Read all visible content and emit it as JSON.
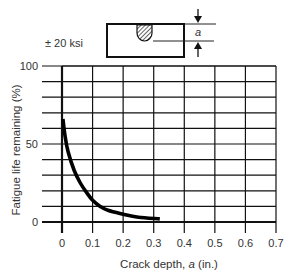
{
  "chart_data": {
    "type": "line",
    "title": "",
    "xlabel": "Crack depth, a (in.)",
    "ylabel": "Fatigue life remaining (%)",
    "xlim": [
      0,
      0.7
    ],
    "ylim": [
      0,
      100
    ],
    "x_ticks": [
      "0",
      "0.1",
      "0.2",
      "0.3",
      "0.4",
      "0.5",
      "0.6",
      "0.7"
    ],
    "y_ticks": [
      "0",
      "50",
      "100"
    ],
    "y_minor_gridlines_every": 10,
    "grid": true,
    "legend": null,
    "series": [
      {
        "name": "Fatigue life remaining",
        "x": [
          0.003,
          0.01,
          0.02,
          0.04,
          0.06,
          0.08,
          0.1,
          0.125,
          0.15,
          0.2,
          0.25,
          0.32
        ],
        "y": [
          66,
          55,
          45,
          33,
          25,
          19,
          14,
          10,
          7.5,
          5,
          3,
          2
        ]
      }
    ],
    "annotations": [
      {
        "text": "± 20 ksi",
        "role": "stress-amplitude-label"
      },
      {
        "text": "a",
        "role": "crack-depth-dimension-label"
      }
    ]
  },
  "annotations": {
    "stress_label": "± 20 ksi",
    "dimension_label": "a"
  },
  "axes": {
    "xlabel_prefix": "Crack depth, ",
    "xlabel_var": "a",
    "xlabel_suffix": " (in.)",
    "ylabel": "Fatigue life remaining (%)"
  }
}
